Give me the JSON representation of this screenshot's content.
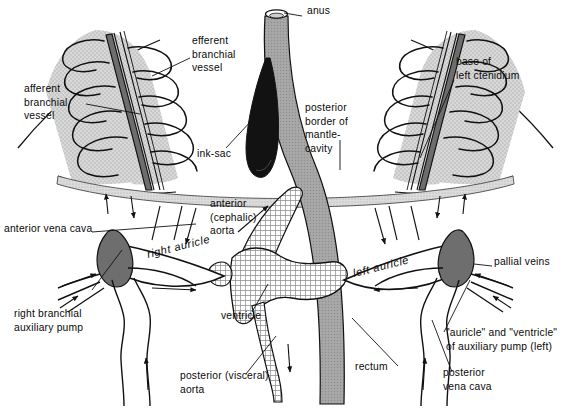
{
  "figure": {
    "kind": "anatomical-diagram",
    "background_color": "#ffffff",
    "ink_color": "#111111"
  },
  "palette": {
    "gill_fill": "#d8d8d8",
    "gill_stipple": "#bdbdbd",
    "vessel_dark": "#6a6a6a",
    "vessel_mid": "#8f8f8f",
    "rectum_fill": "#a0a0a0",
    "ink_sac": "#111111",
    "auxiliary_pump": "#6e6e6e",
    "ventricle_hatch": "#9a9a9a",
    "mantle_band": "#cfcfcf"
  },
  "labels": [
    {
      "id": "anus",
      "text": "anus",
      "x": 307,
      "y": 14,
      "anchor": "start",
      "align": "left"
    },
    {
      "id": "efferent-branchial-vessel",
      "text": "efferent\nbranchial\nvessel",
      "x": 192,
      "y": 44,
      "anchor": "start",
      "align": "left"
    },
    {
      "id": "afferent-branchial-vessel",
      "text": "afferent\nbranchial\nvessel",
      "x": 24,
      "y": 92,
      "anchor": "start",
      "align": "left"
    },
    {
      "id": "base-of-left-ctenidium",
      "text": "base of\nleft ctenidium",
      "x": 456,
      "y": 65,
      "anchor": "start",
      "align": "left"
    },
    {
      "id": "posterior-border-mantle",
      "text": "posterior\nborder of\nmantle-\ncavity",
      "x": 305,
      "y": 111,
      "anchor": "start",
      "align": "left"
    },
    {
      "id": "ink-sac",
      "text": "ink-sac",
      "x": 197,
      "y": 157,
      "anchor": "start",
      "align": "left"
    },
    {
      "id": "anterior-cephalic-aorta",
      "text": "anterior\n(cephalic)\naorta",
      "x": 210,
      "y": 207,
      "anchor": "start",
      "align": "left"
    },
    {
      "id": "anterior-vena-cava",
      "text": "anterior vena cava",
      "x": 4,
      "y": 232,
      "anchor": "start",
      "align": "left"
    },
    {
      "id": "right-auricle",
      "text": "right auricle",
      "x": 148,
      "y": 258,
      "anchor": "start",
      "align": "left",
      "italic": true,
      "rotate": -14
    },
    {
      "id": "left-auricle",
      "text": "left auricle",
      "x": 354,
      "y": 277,
      "anchor": "start",
      "align": "left",
      "italic": true,
      "rotate": -14
    },
    {
      "id": "pallial-veins",
      "text": "pallial veins",
      "x": 494,
      "y": 265,
      "anchor": "start",
      "align": "left"
    },
    {
      "id": "right-branchial-pump",
      "text": "right branchial\nauxiliary pump",
      "x": 14,
      "y": 317,
      "anchor": "start",
      "align": "left"
    },
    {
      "id": "ventricle",
      "text": "ventricle",
      "x": 221,
      "y": 319,
      "anchor": "start",
      "align": "left"
    },
    {
      "id": "auricle-ventricle-aux",
      "text": "\"auricle\" and \"ventricle\"\nof auxiliary pump (left)",
      "x": 446,
      "y": 336,
      "anchor": "start",
      "align": "left"
    },
    {
      "id": "rectum",
      "text": "rectum",
      "x": 355,
      "y": 370,
      "anchor": "start",
      "align": "left"
    },
    {
      "id": "posterior-visceral-aorta",
      "text": "posterior (visceral)\naorta",
      "x": 180,
      "y": 379,
      "anchor": "start",
      "align": "left"
    },
    {
      "id": "posterior-vena-cava",
      "text": "posterior\nvena cava",
      "x": 443,
      "y": 376,
      "anchor": "start",
      "align": "left"
    }
  ],
  "structures": [
    {
      "id": "right-ctenidium",
      "name": "right ctenidium (gill)"
    },
    {
      "id": "left-ctenidium",
      "name": "left ctenidium (gill)"
    },
    {
      "id": "ink-sac-body",
      "name": "ink sac"
    },
    {
      "id": "rectum-body",
      "name": "rectum"
    },
    {
      "id": "mantle-border-band",
      "name": "posterior border of mantle cavity"
    },
    {
      "id": "ventricle-body",
      "name": "ventricle"
    },
    {
      "id": "right-auricle-body",
      "name": "right auricle"
    },
    {
      "id": "left-auricle-body",
      "name": "left auricle"
    },
    {
      "id": "right-aux-pump",
      "name": "right branchial auxiliary pump"
    },
    {
      "id": "left-aux-pump",
      "name": "left branchial auxiliary pump"
    },
    {
      "id": "cephalic-aorta-body",
      "name": "anterior (cephalic) aorta"
    },
    {
      "id": "visceral-aorta-body",
      "name": "posterior (visceral) aorta"
    }
  ]
}
